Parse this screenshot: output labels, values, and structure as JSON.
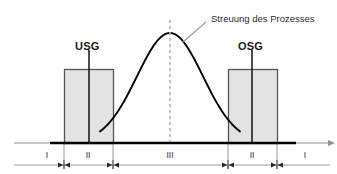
{
  "figure": {
    "title_visible": false,
    "width": 337,
    "height": 174,
    "background": "#ffffff"
  },
  "colors": {
    "curve": "#000000",
    "box_fill": "#e3e3e3",
    "box_stroke": "#555555",
    "axis": "#808080",
    "baseline": "#000000",
    "center_dash": "#b5b5b5",
    "leader": "#8c8c8c",
    "text": "#1a1a1a"
  },
  "annotations": {
    "process_spread": "Streuung des Prozesses",
    "lower_spec_limit": "USG",
    "upper_spec_limit": "OSG"
  },
  "zones": [
    {
      "label": "I",
      "center_x": 47,
      "from_x": 14,
      "to_x": 64
    },
    {
      "label": "II",
      "center_x": 88,
      "from_x": 64,
      "to_x": 113
    },
    {
      "label": "III",
      "center_x": 170,
      "from_x": 113,
      "to_x": 228
    },
    {
      "label": "II",
      "center_x": 252,
      "from_x": 228,
      "to_x": 277
    },
    {
      "label": "I",
      "center_x": 305,
      "from_x": 277,
      "to_x": 330
    }
  ],
  "zone_boundaries": [
    64,
    113,
    228,
    277
  ],
  "spec_boxes": [
    {
      "name": "usg",
      "x": 64,
      "y": 69,
      "width": 49,
      "height": 74,
      "line_x": 89
    },
    {
      "name": "osg",
      "x": 228,
      "y": 69,
      "width": 49,
      "height": 74,
      "line_x": 252
    }
  ],
  "curve": {
    "mean_x": 170,
    "peak_y": 33,
    "baseline_y": 143,
    "sigma_px": 33,
    "start_x": 100,
    "end_x": 240
  },
  "axes": {
    "baseline_y": 143,
    "baseline_from_x": 14,
    "baseline_to_x": 330,
    "zone_axis_y": 165,
    "zone_axis_from_x": 14,
    "zone_axis_to_x": 330,
    "thick_from_x": 50,
    "thick_to_x": 296
  },
  "callout": {
    "text_x": 211,
    "text_y": 14,
    "leader_from_x": 206,
    "leader_from_y": 22,
    "leader_to_x": 183,
    "leader_to_y": 42
  }
}
